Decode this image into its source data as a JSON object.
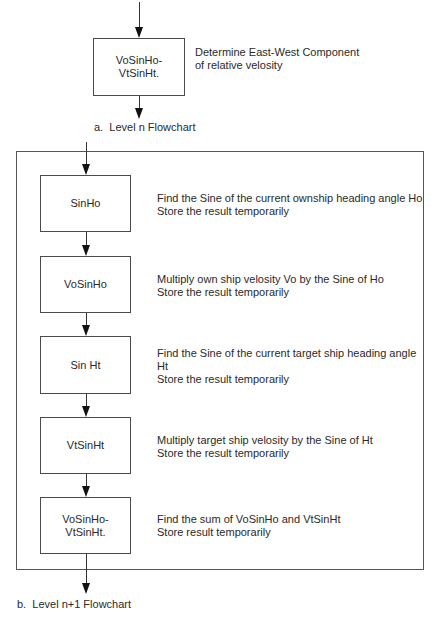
{
  "level_n": {
    "caption": "a.  Level n Flowchart",
    "box_label": "VoSinHo-\nVtSinHt.",
    "description": "Determine East-West Component\nof relative velosity"
  },
  "level_n_plus_1": {
    "caption": "b.  Level n+1 Flowchart",
    "steps": [
      {
        "label": "SinHo",
        "description": "Find the Sine of the current ownship heading angle Ho\nStore the result temporarily"
      },
      {
        "label": "VoSinHo",
        "description": "Multiply own ship velosity Vo by the Sine of Ho\nStore the result temporarily"
      },
      {
        "label": "Sin Ht",
        "description": "Find the Sine of the current target ship heading angle\nHt\nStore the result temporarily"
      },
      {
        "label": "VtSinHt",
        "description": "Multiply target ship velosity by the Sine of Ht\nStore the result temporarily"
      },
      {
        "label": "VoSinHo-\nVtSinHt.",
        "description": "Find the sum of VoSinHo and VtSinHt\nStore result temporarily"
      }
    ]
  },
  "colors": {
    "line": "#333333",
    "text": "#2a2a2a",
    "background": "#ffffff"
  }
}
